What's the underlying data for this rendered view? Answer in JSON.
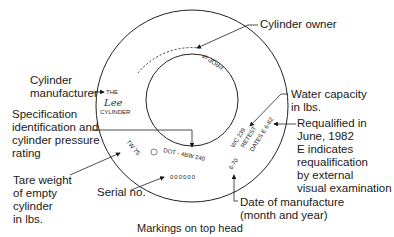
{
  "diagram": {
    "caption": "Markings on top head",
    "labels": {
      "cylinder_owner": "Cylinder owner",
      "cylinder_manufacturer": [
        "Cylinder",
        "manufacturer"
      ],
      "specification": [
        "Specification",
        "identification and",
        "cylinder pressure",
        "rating"
      ],
      "tare_weight": [
        "Tare weight",
        "of empty",
        "cylinder",
        "in lbs."
      ],
      "serial_no": "Serial no.",
      "water_capacity": [
        "Water capacity",
        "in lbs."
      ],
      "requalified": [
        "Requalified in",
        "June, 1982",
        "E indicates",
        "requalification",
        "by external",
        "visual examination"
      ],
      "date_of_manufacture": [
        "Date of manufacture",
        "(month and year)"
      ]
    },
    "markings": {
      "owner": "PROP of",
      "manufacturer_line1": "THE",
      "manufacturer_logo": "Lee",
      "manufacturer_line2": "CYLINDER",
      "tare": "TW 75",
      "spec": "DOT - 4BW 240",
      "serial": "000000",
      "water_capacity": "WC 239",
      "retest": "RETEST",
      "dates": "DATES E 6-82",
      "manufacture_date": "6-70"
    }
  }
}
